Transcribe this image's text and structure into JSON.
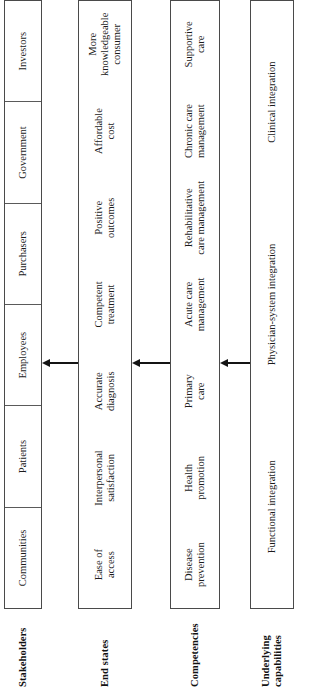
{
  "figure": {
    "caption": "",
    "orientation": "rotated-90-ccw",
    "arrow_icon": "arrow-up"
  },
  "tiers": [
    {
      "id": "stakeholders",
      "label": "Stakeholders",
      "ruled": true,
      "cells": [
        "Communities",
        "Patients",
        "Employees",
        "Purchasers",
        "Government",
        "Investors"
      ]
    },
    {
      "id": "end-states",
      "label": "End states",
      "ruled": false,
      "cells": [
        "Ease of\naccess",
        "Interpersonal\nsatisfaction",
        "Accurate\ndiagnosis",
        "Competent\ntreatment",
        "Positive\noutcomes",
        "Affordable\ncost",
        "More\nknowledgeable\nconsumer"
      ]
    },
    {
      "id": "competencies",
      "label": "Competencies",
      "ruled": false,
      "cells": [
        "Disease\nprevention",
        "Health\npromotion",
        "Primary\ncare",
        "Acute care\nmanagement",
        "Rehabilitative\ncare management",
        "Chronic care\nmanagement",
        "Supportive\ncare"
      ]
    },
    {
      "id": "underlying-capabilities",
      "label": "Underlying\ncapabilities",
      "ruled": false,
      "cells": [
        "Functional integration",
        "Physician-system integration",
        "Clinical integration"
      ]
    }
  ],
  "arrows": [
    {
      "name": "arrow-competencies-to-end-states",
      "direction": "up"
    },
    {
      "name": "arrow-capabilities-to-competencies",
      "direction": "up"
    },
    {
      "name": "arrow-end-states-to-stakeholders",
      "direction": "up"
    }
  ],
  "colors": {
    "border": "#4a4a4a",
    "rule": "#5a5a5a",
    "text": "#1b1b1b",
    "arrow": "#141414",
    "background": "#ffffff"
  }
}
